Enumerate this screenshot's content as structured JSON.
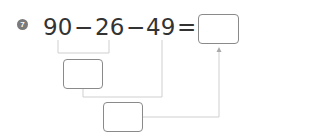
{
  "problem": {
    "number": "7",
    "terms": {
      "a": "90",
      "op1": "−",
      "b": "26",
      "op2": "−",
      "c": "49",
      "eq": "="
    },
    "answer_box": "",
    "step1_box": "",
    "step2_box": ""
  },
  "colors": {
    "badge": "#7a7a7a",
    "text": "#333333",
    "lines": "#c8c8c8",
    "box_border": "#8a8a8a"
  }
}
